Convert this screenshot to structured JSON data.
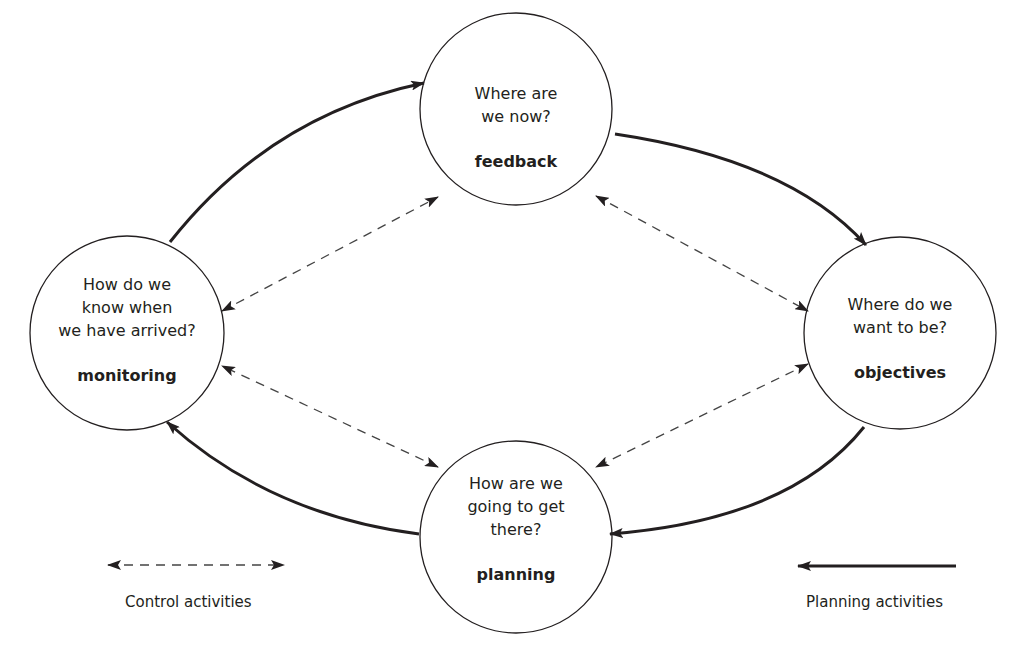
{
  "nodes": {
    "feedback": {
      "question_lines": [
        "Where are",
        "we now?"
      ],
      "keyword": "feedback"
    },
    "objectives": {
      "question_lines": [
        "Where do we",
        "want to be?"
      ],
      "keyword": "objectives"
    },
    "planning": {
      "question_lines": [
        "How are we",
        "going to get",
        "there?"
      ],
      "keyword": "planning"
    },
    "monitoring": {
      "question_lines": [
        "How do we",
        "know when",
        "we have arrived?"
      ],
      "keyword": "monitoring"
    }
  },
  "legend": {
    "control": {
      "label": "Control activities",
      "style": "dashed-bidirectional"
    },
    "planning": {
      "label": "Planning activities",
      "style": "solid-unidirectional"
    }
  },
  "colors": {
    "stroke": "#231f20",
    "dashed": "#444444",
    "background": "#ffffff"
  }
}
